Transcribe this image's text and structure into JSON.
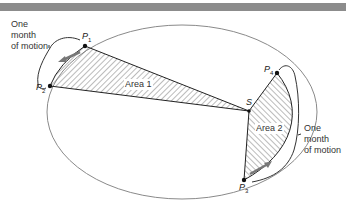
{
  "figure": {
    "points": {
      "p1": {
        "label": "P",
        "sub": "1"
      },
      "p2": {
        "label": "P",
        "sub": "2"
      },
      "p3": {
        "label": "P",
        "sub": "3"
      },
      "p4": {
        "label": "P",
        "sub": "4"
      },
      "sun": {
        "label": "S"
      }
    },
    "areas": {
      "area1": "Area 1",
      "area2": "Area 2"
    },
    "annotations": {
      "left_line1": "One",
      "left_line2": "month",
      "left_line3": "of motion",
      "right_line1": "One",
      "right_line2": "month",
      "right_line3": "of motion"
    },
    "colors": {
      "orbit": "#8a8a8a",
      "bar": "#8c8c8c",
      "hatch": "#555555",
      "arrow": "#777777"
    }
  }
}
